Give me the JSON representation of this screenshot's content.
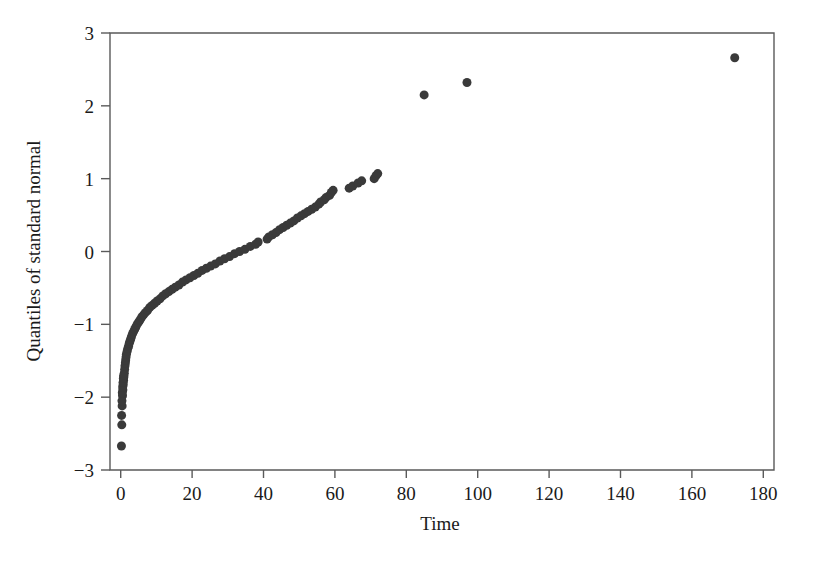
{
  "chart_data": {
    "type": "scatter",
    "title": "",
    "subtitle": "",
    "xlabel": "Time",
    "ylabel": "Quantiles of standard normal",
    "xlim": [
      -3,
      183
    ],
    "ylim": [
      -3,
      3
    ],
    "xticks": [
      0,
      20,
      40,
      60,
      80,
      100,
      120,
      140,
      160,
      180
    ],
    "xticklabels": [
      "0",
      "20",
      "40",
      "60",
      "80",
      "100",
      "120",
      "140",
      "160",
      "180"
    ],
    "yticks": [
      -3,
      -2,
      -1,
      0,
      1,
      2,
      3
    ],
    "yticklabels": [
      "-3",
      "-2",
      "-1",
      "0",
      "1",
      "2",
      "3"
    ],
    "grid": false,
    "legend": false,
    "legend_position": "none",
    "marker": "filled-circle",
    "marker_color": "#3a3a3a",
    "marker_size_px": 9,
    "frame_color": "#5a5a5a",
    "background_color": "#ffffff",
    "n_points": 101,
    "series": [
      {
        "name": "Time vs normal quantiles",
        "x": [
          0.2,
          0.3,
          0.4,
          0.5,
          0.6,
          0.7,
          0.8,
          0.9,
          1.0,
          1.1,
          1.2,
          1.3,
          1.4,
          1.5,
          1.6,
          1.8,
          2.0,
          2.2,
          2.4,
          2.6,
          2.8,
          3.0,
          3.3,
          3.6,
          3.9,
          4.2,
          4.6,
          5.0,
          5.4,
          5.9,
          6.4,
          6.9,
          7.5,
          8.1,
          8.8,
          9.5,
          10.2,
          11.0,
          11.8,
          12.6,
          13.5,
          14.4,
          15.3,
          16.3,
          17.3,
          18.3,
          19.4,
          20.5,
          21.6,
          22.8,
          24.0,
          25.2,
          26.5,
          27.8,
          29.1,
          30.5,
          31.9,
          33.3,
          34.8,
          36.3,
          37.8,
          38.5,
          41.0,
          41.5,
          42.5,
          43.5,
          44.5,
          45.5,
          46.5,
          47.5,
          48.5,
          49.5,
          50.5,
          51.5,
          52.5,
          53.5,
          54.5,
          55.5,
          56.0,
          57.0,
          57.5,
          58.5,
          59.0,
          59.5,
          64.0,
          65.0,
          66.5,
          67.5,
          71.0,
          71.5,
          72.0,
          85.0,
          97.0,
          172.0,
          0.25,
          0.35,
          0.45,
          0.55,
          0.65,
          0.75,
          0.85
        ],
        "y": [
          -2.67,
          -2.38,
          -2.12,
          -1.98,
          -1.9,
          -1.83,
          -1.77,
          -1.72,
          -1.67,
          -1.62,
          -1.57,
          -1.53,
          -1.49,
          -1.45,
          -1.41,
          -1.37,
          -1.33,
          -1.3,
          -1.26,
          -1.23,
          -1.2,
          -1.17,
          -1.13,
          -1.1,
          -1.07,
          -1.04,
          -1.0,
          -0.97,
          -0.94,
          -0.9,
          -0.87,
          -0.84,
          -0.81,
          -0.77,
          -0.74,
          -0.71,
          -0.68,
          -0.65,
          -0.61,
          -0.58,
          -0.55,
          -0.52,
          -0.49,
          -0.46,
          -0.42,
          -0.39,
          -0.36,
          -0.33,
          -0.3,
          -0.26,
          -0.23,
          -0.2,
          -0.17,
          -0.13,
          -0.1,
          -0.07,
          -0.03,
          0.0,
          0.03,
          0.07,
          0.1,
          0.13,
          0.17,
          0.2,
          0.23,
          0.26,
          0.3,
          0.33,
          0.36,
          0.39,
          0.42,
          0.46,
          0.49,
          0.52,
          0.55,
          0.58,
          0.61,
          0.65,
          0.68,
          0.71,
          0.74,
          0.77,
          0.81,
          0.84,
          0.87,
          0.9,
          0.94,
          0.97,
          1.0,
          1.04,
          1.07,
          2.15,
          2.32,
          2.66,
          -2.25,
          -2.05,
          -1.94,
          -1.86,
          -1.8,
          -1.74,
          -1.7
        ]
      }
    ]
  }
}
